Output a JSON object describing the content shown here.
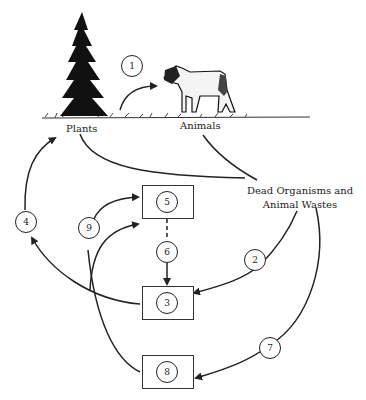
{
  "diagram": {
    "type": "nitrogen/nutrient cycle illustration",
    "labels": {
      "plants": "Plants",
      "animals": "Animals",
      "dead_organisms_line1": "Dead Organisms and",
      "dead_organisms_line2": "Animal Wastes"
    },
    "step_numbers": [
      "1",
      "2",
      "3",
      "4",
      "5",
      "6",
      "7",
      "8",
      "9"
    ],
    "boxes": [
      {
        "id": "box-5",
        "number": "5"
      },
      {
        "id": "box-3",
        "number": "3"
      },
      {
        "id": "box-8",
        "number": "8"
      }
    ],
    "arrows": [
      {
        "from": "Plants",
        "to": "Animals",
        "label": "1"
      },
      {
        "from": "Plants",
        "to": "Dead Organisms and Animal Wastes",
        "label": ""
      },
      {
        "from": "Animals",
        "to": "Dead Organisms and Animal Wastes",
        "label": ""
      },
      {
        "from": "Dead Organisms and Animal Wastes",
        "to": "3",
        "label": "2"
      },
      {
        "from": "3",
        "to": "Plants",
        "label": "4"
      },
      {
        "from": "5",
        "to": "3",
        "label": "6",
        "style": "dashed"
      },
      {
        "from": "Dead Organisms and Animal Wastes",
        "to": "8",
        "label": "7"
      },
      {
        "from": "8",
        "to": "5",
        "label": "9"
      },
      {
        "from": "3",
        "to": "5",
        "label": ""
      }
    ],
    "colors": {
      "line": "#222222",
      "background": "#ffffff"
    }
  }
}
